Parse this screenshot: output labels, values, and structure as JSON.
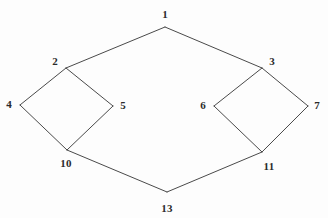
{
  "figure": {
    "background_color": "#fdfdfd",
    "edge_color": "#4a4a4a",
    "label_color": "#2b2b2b",
    "width": 328,
    "height": 218
  },
  "graph": {
    "nodes": [
      {
        "id": "1",
        "label": "1",
        "x": 165,
        "y": 27,
        "label_x": 165,
        "label_y": 14
      },
      {
        "id": "2",
        "label": "2",
        "x": 66,
        "y": 68,
        "label_x": 55,
        "label_y": 61
      },
      {
        "id": "3",
        "label": "3",
        "x": 262,
        "y": 68,
        "label_x": 272,
        "label_y": 61
      },
      {
        "id": "4",
        "label": "4",
        "x": 20,
        "y": 105,
        "label_x": 9,
        "label_y": 104
      },
      {
        "id": "5",
        "label": "5",
        "x": 113,
        "y": 106,
        "label_x": 123,
        "label_y": 105
      },
      {
        "id": "6",
        "label": "6",
        "x": 214,
        "y": 106,
        "label_x": 203,
        "label_y": 105
      },
      {
        "id": "7",
        "label": "7",
        "x": 308,
        "y": 106,
        "label_x": 317,
        "label_y": 105
      },
      {
        "id": "10",
        "label": "10",
        "x": 67,
        "y": 150,
        "label_x": 66,
        "label_y": 163
      },
      {
        "id": "11",
        "label": "11",
        "x": 262,
        "y": 152,
        "label_x": 269,
        "label_y": 166
      },
      {
        "id": "13",
        "label": "13",
        "x": 167,
        "y": 192,
        "label_x": 167,
        "label_y": 208
      }
    ],
    "edges": [
      {
        "from": "1",
        "to": "2"
      },
      {
        "from": "1",
        "to": "3"
      },
      {
        "from": "2",
        "to": "4"
      },
      {
        "from": "2",
        "to": "5"
      },
      {
        "from": "4",
        "to": "10"
      },
      {
        "from": "5",
        "to": "10"
      },
      {
        "from": "3",
        "to": "6"
      },
      {
        "from": "3",
        "to": "7"
      },
      {
        "from": "6",
        "to": "11"
      },
      {
        "from": "7",
        "to": "11"
      },
      {
        "from": "10",
        "to": "13"
      },
      {
        "from": "11",
        "to": "13"
      }
    ]
  }
}
